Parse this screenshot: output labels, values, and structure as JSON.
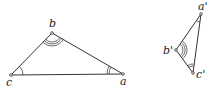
{
  "figure": {
    "type": "similar-triangles",
    "triangle_1": {
      "vertices": {
        "a": {
          "label": "a",
          "x": 123,
          "y": 74
        },
        "b": {
          "label": "b",
          "x": 52,
          "y": 33
        },
        "c": {
          "label": "c",
          "x": 11,
          "y": 75
        }
      },
      "angle_marks": {
        "a": 2,
        "b": 3,
        "c": 1
      }
    },
    "triangle_2": {
      "vertices": {
        "a": {
          "label": "a'",
          "x": 201,
          "y": 14
        },
        "b": {
          "label": "b'",
          "x": 176,
          "y": 50
        },
        "c": {
          "label": "c'",
          "x": 193,
          "y": 73
        }
      },
      "angle_marks": {
        "a": 1,
        "b": 3,
        "c": 2
      }
    }
  }
}
